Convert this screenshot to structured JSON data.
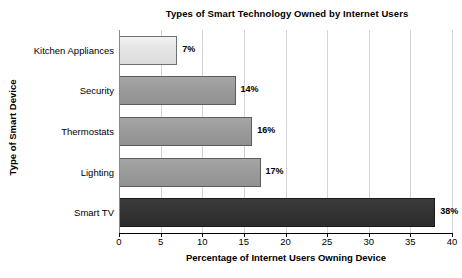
{
  "chart_data": {
    "type": "bar",
    "orientation": "horizontal",
    "title": "Types of Smart Technology Owned by Internet Users",
    "xlabel": "Percentage of Internet Users Owning Device",
    "ylabel": "Type of Smart Device",
    "categories": [
      "Kitchen Appliances",
      "Security",
      "Thermostats",
      "Lighting",
      "Smart TV"
    ],
    "values": [
      7,
      14,
      16,
      17,
      38
    ],
    "data_labels": [
      "7%",
      "14%",
      "16%",
      "17%",
      "38%"
    ],
    "xlim": [
      0,
      40
    ],
    "xticks": [
      0,
      5,
      10,
      15,
      20,
      25,
      30,
      35,
      40
    ],
    "xtick_labels": [
      "0",
      "5",
      "10",
      "15",
      "20",
      "25",
      "30",
      "35",
      "40"
    ],
    "grid": "vertical",
    "legend": "none",
    "bar_colors": [
      "#e4e4e4",
      "#9b9b9b",
      "#9b9b9b",
      "#9b9b9b",
      "#333333"
    ],
    "bar_shades": [
      "light",
      "mid",
      "mid",
      "mid",
      "dark"
    ],
    "bar_border_color": "#5c5c5c",
    "gridline_color": "#d4d4d4",
    "axis_color": "#000000",
    "background_color": "#ffffff"
  }
}
